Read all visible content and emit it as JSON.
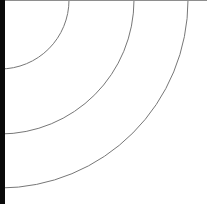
{
  "figure": {
    "width": 207,
    "height": 204,
    "background_color": "#ffffff",
    "center": {
      "x": 0,
      "y": 0
    },
    "arc_stroke_color": "#777777",
    "arc_stroke_width": 1,
    "arcs": [
      {
        "name": "arc-inner",
        "radius": 69
      },
      {
        "name": "arc-middle",
        "radius": 134
      },
      {
        "name": "arc-outer",
        "radius": 188
      }
    ],
    "left_edge_band": {
      "name": "left-edge-band",
      "color": "#0a0a0a",
      "width": 5
    },
    "top_edge_line": {
      "name": "top-edge-line",
      "color": "#8e8e8e",
      "height": 1
    },
    "edge_crossings": {
      "top_x": [
        69,
        134,
        188
      ],
      "left_y": [
        69,
        134,
        188
      ]
    }
  },
  "chart_data": {
    "type": "line",
    "title": "",
    "xlabel": "",
    "ylabel": "",
    "grid": false,
    "legend": null,
    "xlim": [
      0,
      207
    ],
    "ylim": [
      0,
      204
    ],
    "series": [
      {
        "name": "arc-inner",
        "radius": 69,
        "center": [
          0,
          0
        ],
        "start_angle_deg": 0,
        "end_angle_deg": 90
      },
      {
        "name": "arc-middle",
        "radius": 134,
        "center": [
          0,
          0
        ],
        "start_angle_deg": 0,
        "end_angle_deg": 90
      },
      {
        "name": "arc-outer",
        "radius": 188,
        "center": [
          0,
          0
        ],
        "start_angle_deg": 0,
        "end_angle_deg": 90
      }
    ]
  }
}
